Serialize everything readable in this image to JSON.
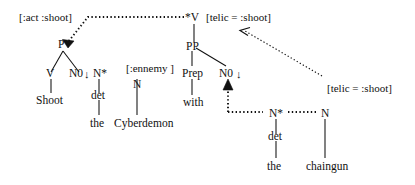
{
  "figure": {
    "kind": "tag-derivation-diagram",
    "background_color": "#ffffff",
    "ink_color": "#111111",
    "width": 415,
    "height": 185
  },
  "trees": {
    "shoot_tree": {
      "name": "shoot-elementary-tree",
      "nodes": {
        "root": "P",
        "verb": "V",
        "object_slot": "N0↓",
        "anchor_word": "Shoot"
      },
      "feature_label": "[:act :shoot]"
    },
    "cyberdemon_tree": {
      "name": "cyberdemon-noun-tree",
      "nodes": {
        "foot": "N*",
        "det": "det",
        "det_word": "the",
        "head": "N",
        "head_word": "Cyberdemon"
      },
      "feature_label": "[:ennemy ]"
    },
    "with_tree": {
      "name": "with-pp-tree",
      "nodes": {
        "root": "*V",
        "pp": "PP",
        "prep": "Prep",
        "prep_word": "with",
        "object_slot": "N0 ↓"
      },
      "feature_label": "[telic = :shoot]"
    },
    "chaingun_tree": {
      "name": "chaingun-noun-tree",
      "nodes": {
        "foot": "N*",
        "det": "det",
        "det_word": "the",
        "head": "N",
        "head_word": "chaingun"
      },
      "feature_label": "[telic = :shoot]"
    }
  },
  "labels": {
    "act_shoot": "[:act :shoot]",
    "telic_shoot_top": "[telic = :shoot]",
    "telic_shoot_bottom": "[telic = :shoot]",
    "ennemy": "[:ennemy ]",
    "node_P": "P",
    "node_V": "V",
    "node_N0_left": "N0",
    "node_Nstar_left": "N*",
    "node_N_cyberdemon": "N",
    "node_Vstar": "*V",
    "node_PP": "PP",
    "node_Prep": "Prep",
    "node_N0_right": "N0",
    "node_det_left": "det",
    "node_det_right": "det",
    "node_Nstar_right": "N*",
    "node_N_chaingun": "N",
    "word_shoot": "Shoot",
    "word_the_left": "the",
    "word_cyberdemon": "Cyberdemon",
    "word_with": "with",
    "word_the_right": "the",
    "word_chaingun": "chaingun",
    "subst_arrow_left": "↓",
    "subst_arrow_right": "↓"
  }
}
